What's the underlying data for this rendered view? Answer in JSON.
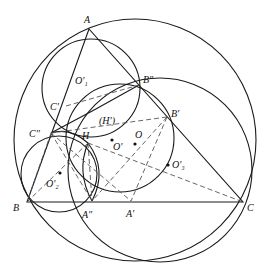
{
  "diagram": {
    "type": "geometry-construction",
    "labels": {
      "A": "A",
      "B": "B",
      "C": "C",
      "B2": "B\"",
      "B1": "B'",
      "C1": "C'",
      "C2": "C\"",
      "H": "H",
      "H1": "(H')",
      "A2": "A\"",
      "A1": "A'",
      "O": "O",
      "O1": "O'",
      "O1p": "O'₁",
      "O2p": "O'₂",
      "O3p": "O'₃"
    },
    "colors": {
      "stroke": "#1a1a1a",
      "dashed": "#555555",
      "background": "#ffffff"
    }
  }
}
